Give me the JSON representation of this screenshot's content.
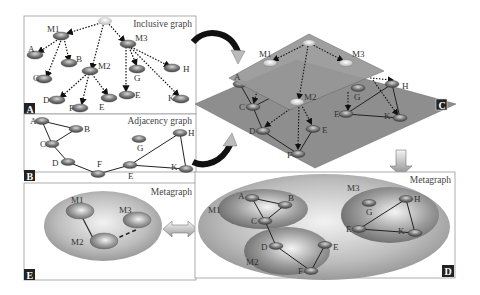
{
  "panels": {
    "A": {
      "tag": "A",
      "title": "Inclusive graph"
    },
    "B": {
      "tag": "B",
      "title": "Adjacency graph"
    },
    "C": {
      "tag": "C"
    },
    "D": {
      "tag": "D",
      "title": "Metagraph"
    },
    "E": {
      "tag": "E",
      "title": "Metagraph"
    }
  },
  "nodes": {
    "M1": "M1",
    "M2": "M2",
    "M3": "M3",
    "A": "A",
    "B": "B",
    "C": "C",
    "D": "D",
    "E": "E",
    "F": "F",
    "G": "G",
    "H": "H",
    "K": "K"
  },
  "colors": {
    "panel_border": "#999999",
    "plane": "#8c8c8c",
    "node": "#6e6e6e",
    "tag_bg": "#222222",
    "meta_ellipse": "#a8a8a8"
  }
}
